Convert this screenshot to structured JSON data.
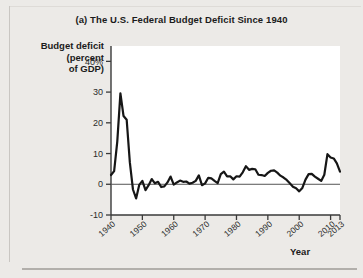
{
  "figure": {
    "label": "(a)",
    "title": "(a) The U.S. Federal Budget Deficit Since 1940",
    "ylabel_lines": [
      "Budget deficit",
      "(percent",
      "of GDP)"
    ],
    "ylabel": "Budget deficit (percent of GDP)",
    "xlabel": "Year",
    "background_color": "#eceae7",
    "plot_background_color": "#ffffff",
    "line_color": "#161616",
    "axis_color": "#3a3a3a"
  },
  "chart_data": {
    "type": "line",
    "title": "(a) The U.S. Federal Budget Deficit Since 1940",
    "xlabel": "Year",
    "ylabel": "Budget deficit (percent of GDP)",
    "xlim": [
      1940,
      2013
    ],
    "ylim": [
      -10,
      45
    ],
    "grid": false,
    "legend": null,
    "yticks": [
      {
        "value": 40,
        "label": "40%"
      },
      {
        "value": 30,
        "label": "30"
      },
      {
        "value": 20,
        "label": "20"
      },
      {
        "value": 10,
        "label": "10"
      },
      {
        "value": 0,
        "label": "0"
      },
      {
        "value": -10,
        "label": "-10"
      }
    ],
    "xticks": [
      {
        "value": 1940,
        "label": "1940"
      },
      {
        "value": 1950,
        "label": "1950"
      },
      {
        "value": 1960,
        "label": "1960"
      },
      {
        "value": 1970,
        "label": "1970"
      },
      {
        "value": 1980,
        "label": "1980"
      },
      {
        "value": 1990,
        "label": "1990"
      },
      {
        "value": 2000,
        "label": "2000"
      },
      {
        "value": 2010,
        "label": "2010"
      },
      {
        "value": 2013,
        "label": "2013"
      }
    ],
    "zero_line": 0,
    "series": [
      {
        "name": "Federal budget deficit (percent of GDP)",
        "x": [
          1940,
          1941,
          1942,
          1943,
          1944,
          1945,
          1946,
          1947,
          1948,
          1949,
          1950,
          1951,
          1952,
          1953,
          1954,
          1955,
          1956,
          1957,
          1958,
          1959,
          1960,
          1961,
          1962,
          1963,
          1964,
          1965,
          1966,
          1967,
          1968,
          1969,
          1970,
          1971,
          1972,
          1973,
          1974,
          1975,
          1976,
          1977,
          1978,
          1979,
          1980,
          1981,
          1982,
          1983,
          1984,
          1985,
          1986,
          1987,
          1988,
          1989,
          1990,
          1991,
          1992,
          1993,
          1994,
          1995,
          1996,
          1997,
          1998,
          1999,
          2000,
          2001,
          2002,
          2003,
          2004,
          2005,
          2006,
          2007,
          2008,
          2009,
          2010,
          2011,
          2012,
          2013
        ],
        "y": [
          3.0,
          4.3,
          13.9,
          29.6,
          22.2,
          21.0,
          7.2,
          -1.7,
          -4.6,
          -0.2,
          1.1,
          -1.9,
          -0.3,
          1.7,
          0.3,
          0.8,
          -0.9,
          -0.7,
          0.6,
          2.5,
          -0.1,
          0.6,
          1.2,
          0.8,
          0.9,
          0.2,
          0.5,
          1.1,
          2.9,
          -0.3,
          0.3,
          2.1,
          1.9,
          1.1,
          0.4,
          3.3,
          4.1,
          2.6,
          2.6,
          1.6,
          2.6,
          2.5,
          3.9,
          5.9,
          4.7,
          5.0,
          4.9,
          3.1,
          3.0,
          2.7,
          3.7,
          4.4,
          4.5,
          3.8,
          2.8,
          2.2,
          1.4,
          0.3,
          -0.8,
          -1.3,
          -2.3,
          -1.2,
          1.5,
          3.3,
          3.4,
          2.5,
          1.8,
          1.1,
          3.1,
          9.8,
          8.7,
          8.4,
          6.8,
          4.1
        ],
        "color": "#161616",
        "line_width": 2.2
      }
    ],
    "annotations": [
      {
        "text": "Peak deficit of about 30% of GDP during World War II (1943)",
        "x": 1943,
        "y": 29.6
      },
      {
        "text": "Budget surpluses in the late 1990s and 2000",
        "x": 2000,
        "y": -2.3
      },
      {
        "text": "Deficit rises to about 10% of GDP in 2009",
        "x": 2009,
        "y": 9.8
      }
    ]
  }
}
